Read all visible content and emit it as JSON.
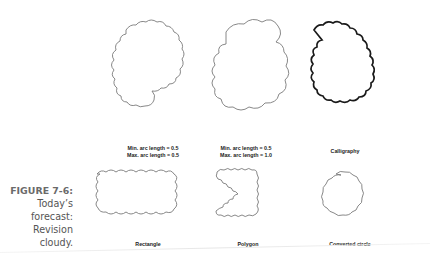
{
  "figure": {
    "number_label": "FIGURE 7-6:",
    "caption_lines": [
      "Today’s",
      "forecast:",
      "Revision",
      "cloudy."
    ]
  },
  "panels": [
    {
      "id": "cloud-small-arc",
      "label_lines": [
        "Min. arc length = 0.5",
        "Max. arc length = 0.5"
      ]
    },
    {
      "id": "cloud-mixed-arc",
      "label_lines": [
        "Min. arc length = 0.5",
        "Max. arc length = 1.0"
      ]
    },
    {
      "id": "cloud-calligraphy",
      "label_lines": [
        "Calligraphy"
      ]
    },
    {
      "id": "cloud-rectangle",
      "label_lines": [
        "Rectangle"
      ]
    },
    {
      "id": "cloud-polygon",
      "label_lines": [
        "Polygon"
      ]
    },
    {
      "id": "cloud-converted-circle",
      "label_lines": [
        "Converted circle"
      ]
    }
  ],
  "colors": {
    "stroke": "#7a7a7a",
    "calligraphy_stroke": "#1a1a1a",
    "caption_text": "#555555"
  }
}
